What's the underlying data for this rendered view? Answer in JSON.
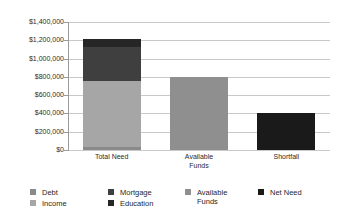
{
  "chart_data": {
    "type": "bar",
    "subtype": "stacked-column",
    "title": "",
    "xlabel": "",
    "ylabel": "",
    "categories": [
      "Total Need",
      "Available\nFunds",
      "Shortfall"
    ],
    "ylim": [
      0,
      1400000
    ],
    "ytick_values": [
      0,
      200000,
      400000,
      600000,
      800000,
      1000000,
      1200000,
      1400000
    ],
    "ytick_labels": [
      "$0",
      "$200,000",
      "$400,000",
      "$600,000",
      "$800,000",
      "$1,000,000",
      "$1,200,000",
      "$1,400,000"
    ],
    "grid": true,
    "legend_position": "bottom",
    "series": [
      {
        "name": "Debt",
        "color": "#8a8a8a",
        "values": [
          30000,
          0,
          0
        ]
      },
      {
        "name": "Income",
        "color": "#a6a6a6",
        "values": [
          730000,
          0,
          0
        ]
      },
      {
        "name": "Mortgage",
        "color": "#3f3f3f",
        "values": [
          370000,
          0,
          0
        ]
      },
      {
        "name": "Education",
        "color": "#262626",
        "values": [
          80000,
          0,
          0
        ]
      },
      {
        "name": "Available Funds",
        "color": "#8f8f8f",
        "values": [
          0,
          800000,
          0
        ]
      },
      {
        "name": "Net Need",
        "color": "#1a1a1a",
        "values": [
          0,
          0,
          410000
        ]
      }
    ],
    "totals": [
      1210000,
      800000,
      410000
    ]
  },
  "legend": {
    "entries": [
      {
        "label": "Debt",
        "color": "#8a8a8a",
        "col": 0,
        "row": 0
      },
      {
        "label": "Income",
        "color": "#a6a6a6",
        "col": 0,
        "row": 1
      },
      {
        "label": "Mortgage",
        "color": "#3f3f3f",
        "col": 1,
        "row": 0
      },
      {
        "label": "Education",
        "color": "#262626",
        "col": 1,
        "row": 1
      },
      {
        "label": "Available\nFunds",
        "color": "#8f8f8f",
        "col": 2,
        "row": 0
      },
      {
        "label": "Net Need",
        "color": "#1a1a1a",
        "col": 3,
        "row": 0
      }
    ]
  },
  "style": {
    "gridline_color": "#c9c9c9",
    "axis_color": "#9a9a9a",
    "text_color": "#2b2b2b",
    "background": "#ffffff"
  }
}
